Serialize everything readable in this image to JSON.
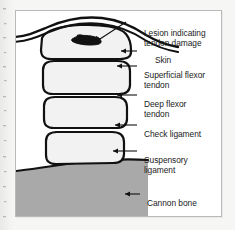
{
  "figure": {
    "kind": "anatomical-diagram",
    "background_color": "#ffffff",
    "border_color": "#b9b9b7",
    "ink_color": "#111111"
  },
  "labels": {
    "lesion": "Lesion indicating\ntendon damage",
    "skin": "Skin",
    "superficial_flexor_tendon": "Superficial flexor\ntendon",
    "deep_flexor_tendon": "Deep flexor\ntendon",
    "check_ligament": "Check ligament",
    "suspensory_ligament": "Suspensory\nligament",
    "cannon_bone": "Cannon bone"
  },
  "structures": [
    {
      "id": "skin",
      "name": "Skin",
      "shape": "wavy double contour line across the top of the limb",
      "fill": "none",
      "stroke": "#111111"
    },
    {
      "id": "superficial-flexor-tendon",
      "name": "Superficial flexor tendon",
      "shape": "rounded block, widest of the stack",
      "fill": "#f2f2f2",
      "stroke": "#111111"
    },
    {
      "id": "lesion",
      "name": "Lesion indicating tendon damage",
      "shape": "small irregular dark blob inside the superficial flexor tendon",
      "fill": "#111111",
      "stroke": "#111111"
    },
    {
      "id": "deep-flexor-tendon",
      "name": "Deep flexor tendon",
      "shape": "rounded block",
      "fill": "#f2f2f2",
      "stroke": "#111111"
    },
    {
      "id": "check-ligament",
      "name": "Check ligament",
      "shape": "rounded block, shorter",
      "fill": "#f2f2f2",
      "stroke": "#111111"
    },
    {
      "id": "suspensory-ligament",
      "name": "Suspensory ligament",
      "shape": "rounded block resting on the cannon bone",
      "fill": "#f2f2f2",
      "stroke": "#111111"
    },
    {
      "id": "cannon-bone",
      "name": "Cannon bone",
      "shape": "solid gray band with gently curved upper surface",
      "fill": "#a9a9a9",
      "stroke": "#111111"
    }
  ],
  "leader_lines": [
    {
      "id": "lesion-leader",
      "target": "lesion",
      "arrow": false
    },
    {
      "id": "skin-leader",
      "target": "skin",
      "arrow": true
    },
    {
      "id": "sft-leader",
      "target": "superficial-flexor-tendon",
      "arrow": true
    },
    {
      "id": "dft-leader",
      "target": "deep-flexor-tendon",
      "arrow": true
    },
    {
      "id": "check-leader",
      "target": "check-ligament",
      "arrow": true
    },
    {
      "id": "susp-leader",
      "target": "suspensory-ligament",
      "arrow": true
    },
    {
      "id": "cannon-leader",
      "target": "cannon-bone",
      "arrow": true
    }
  ]
}
